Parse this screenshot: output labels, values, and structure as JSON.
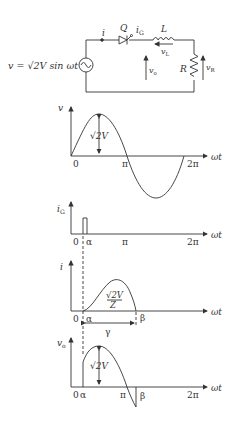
{
  "circuit": {
    "source_label": "v = √2V sin ωt",
    "source_v": "v",
    "source_eq": "=",
    "source_sqrt": "√2V sin ωt",
    "current_label": "i",
    "thyristor_label": "Q",
    "gate_current_label": "i",
    "gate_current_sub": "G",
    "inductor_label": "L",
    "inductor_voltage": "v",
    "inductor_voltage_sub": "L",
    "output_voltage": "v",
    "output_voltage_sub": "o",
    "resistor_label": "R",
    "resistor_voltage": "v",
    "resistor_voltage_sub": "R"
  },
  "plots": {
    "v": {
      "ylabel": "v",
      "xlabel": "ωt",
      "amplitude_label": "√2V",
      "ticks": [
        "0",
        "π",
        "2π"
      ]
    },
    "ig": {
      "ylabel": "i",
      "ylabel_sub": "G",
      "xlabel": "ωt",
      "ticks": [
        "0",
        "α",
        "π",
        "2π"
      ]
    },
    "i": {
      "ylabel": "i",
      "xlabel": "ωt",
      "peak_num": "√2V",
      "peak_den": "Z",
      "ticks": [
        "0",
        "α",
        "β"
      ],
      "span_label": "γ"
    },
    "vo": {
      "ylabel": "v",
      "ylabel_sub": "o",
      "xlabel": "ωt",
      "amplitude_label": "√2V",
      "ticks": [
        "0",
        "α",
        "π",
        "β",
        "2π"
      ]
    }
  },
  "colors": {
    "ink": "#333333",
    "background": "#ffffff"
  }
}
